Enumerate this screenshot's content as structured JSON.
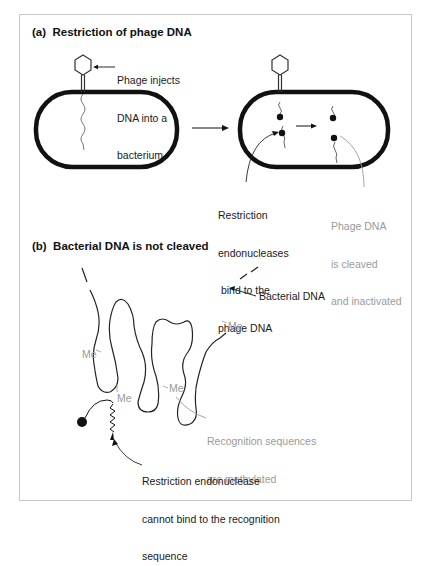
{
  "figure": {
    "panel_a": {
      "heading": "(a)  Restriction of phage DNA",
      "label_phage_injects": [
        "Phage injects",
        "DNA into a",
        "bacterium"
      ],
      "label_restriction_bind": [
        "Restriction",
        "endonucleases",
        " bind to the",
        "phage DNA"
      ],
      "label_phage_cleaved": [
        "Phage DNA",
        "is cleaved",
        "and inactivated"
      ]
    },
    "panel_b": {
      "heading": "(b)  Bacterial DNA is not cleaved",
      "label_bacterial_dna": "Bacterial DNA",
      "methyl_label": "Me",
      "label_recognition": [
        "Recognition sequences",
        "are methylated"
      ],
      "label_cannot_bind": [
        "Restriction endonuclease",
        "cannot bind to the recognition",
        "sequence"
      ]
    },
    "colors": {
      "ink": "#111111",
      "grey_text": "#9a9a9a",
      "frame": "#c8c8c8"
    }
  }
}
